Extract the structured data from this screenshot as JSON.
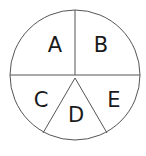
{
  "diagram": {
    "type": "divided-circle",
    "circle": {
      "cx": 75,
      "cy": 75,
      "r": 65,
      "stroke": "#555555"
    },
    "center_point": {
      "x": 75,
      "y": 78
    },
    "lines": [
      {
        "name": "top-divider",
        "x1": 75,
        "y1": 10,
        "x2": 75,
        "y2": 75
      },
      {
        "name": "horizontal-divider",
        "x1": 10,
        "y1": 75,
        "x2": 140,
        "y2": 75
      },
      {
        "name": "left-diagonal",
        "x1": 75,
        "y1": 78,
        "x2": 43,
        "y2": 133
      },
      {
        "name": "right-diagonal",
        "x1": 75,
        "y1": 78,
        "x2": 107,
        "y2": 133
      }
    ],
    "regions": [
      {
        "id": "A",
        "label": "A",
        "x": 55,
        "y": 45
      },
      {
        "id": "B",
        "label": "B",
        "x": 100,
        "y": 45
      },
      {
        "id": "C",
        "label": "C",
        "x": 41,
        "y": 100
      },
      {
        "id": "D",
        "label": "D",
        "x": 76,
        "y": 115
      },
      {
        "id": "E",
        "label": "E",
        "x": 114,
        "y": 100
      }
    ]
  }
}
